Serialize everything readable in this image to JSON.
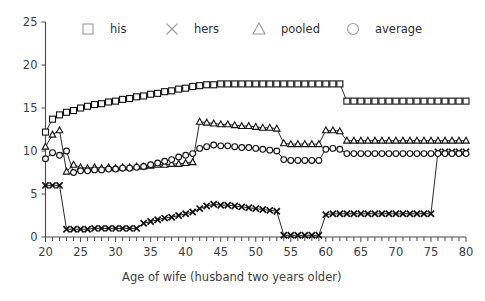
{
  "chart_data": {
    "type": "line",
    "title": "",
    "xlabel": "Age of wife (husband two years older)",
    "ylabel": "",
    "xlim": [
      20,
      80
    ],
    "ylim": [
      0,
      25
    ],
    "xticks": [
      20,
      25,
      30,
      35,
      40,
      45,
      50,
      55,
      60,
      65,
      70,
      75,
      80
    ],
    "xtick_labels": [
      "20",
      "25",
      "30",
      "35",
      "40",
      "45",
      "50",
      "55",
      "60",
      "65",
      "70",
      "75",
      "80"
    ],
    "xtick_minor_step": 1,
    "yticks": [
      0,
      5,
      10,
      15,
      20,
      25
    ],
    "ytick_labels": [
      "0",
      "5",
      "10",
      "15",
      "20",
      "25"
    ],
    "grid": false,
    "legend_position": "top",
    "x": [
      20,
      21,
      22,
      23,
      24,
      25,
      26,
      27,
      28,
      29,
      30,
      31,
      32,
      33,
      34,
      35,
      36,
      37,
      38,
      39,
      40,
      41,
      42,
      43,
      44,
      45,
      46,
      47,
      48,
      49,
      50,
      51,
      52,
      53,
      54,
      55,
      56,
      57,
      58,
      59,
      60,
      61,
      62,
      63,
      64,
      65,
      66,
      67,
      68,
      69,
      70,
      71,
      72,
      73,
      74,
      75,
      76,
      77,
      78,
      79,
      80
    ],
    "series": [
      {
        "name": "his",
        "marker": "square",
        "values": [
          12.2,
          13.7,
          14.2,
          14.5,
          14.7,
          15.0,
          15.2,
          15.4,
          15.5,
          15.7,
          15.8,
          16.0,
          16.1,
          16.3,
          16.4,
          16.6,
          16.7,
          16.9,
          17.0,
          17.2,
          17.3,
          17.5,
          17.6,
          17.7,
          17.7,
          17.8,
          17.8,
          17.8,
          17.8,
          17.8,
          17.8,
          17.8,
          17.8,
          17.8,
          17.8,
          17.8,
          17.8,
          17.8,
          17.8,
          17.8,
          17.8,
          17.8,
          17.8,
          15.8,
          15.8,
          15.8,
          15.8,
          15.8,
          15.8,
          15.8,
          15.8,
          15.8,
          15.8,
          15.8,
          15.8,
          15.8,
          15.8,
          15.8,
          15.8,
          15.8,
          15.8
        ]
      },
      {
        "name": "hers",
        "marker": "x",
        "values": [
          6.0,
          6.0,
          6.0,
          0.9,
          0.9,
          0.9,
          0.9,
          1.0,
          1.0,
          1.0,
          1.0,
          1.0,
          1.0,
          1.0,
          1.6,
          1.8,
          2.0,
          2.2,
          2.3,
          2.5,
          2.7,
          2.9,
          3.3,
          3.6,
          3.8,
          3.7,
          3.7,
          3.6,
          3.5,
          3.4,
          3.3,
          3.2,
          3.1,
          3.0,
          0.2,
          0.2,
          0.2,
          0.2,
          0.2,
          0.2,
          2.6,
          2.7,
          2.7,
          2.7,
          2.7,
          2.7,
          2.7,
          2.7,
          2.7,
          2.7,
          2.7,
          2.7,
          2.7,
          2.7,
          2.7,
          2.7,
          9.9,
          9.9,
          9.9,
          9.9,
          9.9
        ]
      },
      {
        "name": "pooled",
        "marker": "triangle",
        "values": [
          10.5,
          11.9,
          12.4,
          7.6,
          8.4,
          8.1,
          8.0,
          8.1,
          8.0,
          8.1,
          8.0,
          8.1,
          8.1,
          8.2,
          8.2,
          8.3,
          8.4,
          8.4,
          8.5,
          8.5,
          8.6,
          8.7,
          13.4,
          13.3,
          13.2,
          13.1,
          13.1,
          13.0,
          12.9,
          12.9,
          12.8,
          12.7,
          12.7,
          12.6,
          10.9,
          10.8,
          10.8,
          10.8,
          10.8,
          10.8,
          12.4,
          12.4,
          12.3,
          11.2,
          11.2,
          11.2,
          11.2,
          11.2,
          11.2,
          11.2,
          11.2,
          11.2,
          11.2,
          11.2,
          11.2,
          11.2,
          11.2,
          11.2,
          11.2,
          11.2,
          11.2
        ]
      },
      {
        "name": "average",
        "marker": "circle",
        "values": [
          9.1,
          9.8,
          9.5,
          10.0,
          7.5,
          7.7,
          7.7,
          7.8,
          7.8,
          7.9,
          7.9,
          8.0,
          8.0,
          8.1,
          8.2,
          8.4,
          8.6,
          8.8,
          9.0,
          9.3,
          9.5,
          9.7,
          10.3,
          10.5,
          10.7,
          10.6,
          10.6,
          10.5,
          10.4,
          10.4,
          10.3,
          10.2,
          10.1,
          10.0,
          9.0,
          8.9,
          8.9,
          8.9,
          8.9,
          8.9,
          10.2,
          10.3,
          10.2,
          9.7,
          9.7,
          9.7,
          9.7,
          9.7,
          9.7,
          9.7,
          9.7,
          9.7,
          9.7,
          9.7,
          9.7,
          9.7,
          9.7,
          9.7,
          9.7,
          9.7,
          9.7
        ]
      }
    ]
  },
  "legend": {
    "items": [
      {
        "label": "his",
        "marker": "square"
      },
      {
        "label": "hers",
        "marker": "x"
      },
      {
        "label": "pooled",
        "marker": "triangle"
      },
      {
        "label": "average",
        "marker": "circle"
      }
    ]
  }
}
